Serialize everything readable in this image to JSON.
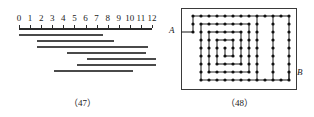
{
  "figures": [
    {
      "id": "fig47",
      "caption": "（47）",
      "type": "interval-diagram",
      "axis": {
        "labels": [
          "0",
          "1",
          "2",
          "3",
          "4",
          "5",
          "6",
          "7",
          "8",
          "9",
          "10",
          "11",
          "12"
        ],
        "min": 0,
        "max": 12,
        "tick_count": 13,
        "line_color": "#2b2b2b",
        "x_start_px": 19,
        "x_end_px": 152,
        "y_px": 28
      },
      "bars": [
        {
          "index": 1,
          "start": 0.0,
          "end": 7.6,
          "y_px": 34
        },
        {
          "index": 2,
          "start": 1.6,
          "end": 8.6,
          "y_px": 40
        },
        {
          "index": 3,
          "start": 1.6,
          "end": 11.6,
          "y_px": 46
        },
        {
          "index": 4,
          "start": 4.3,
          "end": 11.5,
          "y_px": 52
        },
        {
          "index": 5,
          "start": 6.1,
          "end": 12.4,
          "y_px": 58
        },
        {
          "index": 6,
          "start": 5.2,
          "end": 12.4,
          "y_px": 64
        },
        {
          "index": 7,
          "start": 3.2,
          "end": 10.3,
          "y_px": 70
        }
      ],
      "bar_color": "#4a4a4a"
    },
    {
      "id": "fig48",
      "caption": "（48）",
      "type": "spiral-maze-graph",
      "frame": {
        "x_px": 16,
        "y_px": 8,
        "w_px": 114,
        "h_px": 80,
        "border_color": "#3a3a3a"
      },
      "labels": [
        {
          "name": "A",
          "text": "A",
          "x_px": 4,
          "y_px": 26
        },
        {
          "name": "B",
          "text": "B",
          "x_px": 132,
          "y_px": 68
        }
      ],
      "graph": {
        "node_color": "#111111",
        "edge_color": "#2b2b2b",
        "node_radius": 1.6,
        "grid_origin_x": 28,
        "grid_origin_y": 16,
        "grid_step": 8,
        "cols": 11,
        "rows": 9,
        "entry_stub": {
          "from_x": 16,
          "to_x": 28,
          "y": 32
        },
        "exit_stub": {
          "x": 124,
          "from_y": 72,
          "to_y": 80
        },
        "polyline_grid": [
          [
            0,
            2
          ],
          [
            0,
            0
          ],
          [
            8,
            0
          ],
          [
            8,
            8
          ],
          [
            1,
            8
          ],
          [
            1,
            1
          ],
          [
            7,
            1
          ],
          [
            7,
            7
          ],
          [
            2,
            7
          ],
          [
            2,
            2
          ],
          [
            6,
            2
          ],
          [
            6,
            6
          ],
          [
            3,
            6
          ],
          [
            3,
            3
          ],
          [
            5,
            3
          ],
          [
            5,
            5
          ],
          [
            4,
            5
          ],
          [
            4,
            4
          ]
        ],
        "outer_right_path": [
          [
            12,
            0
          ],
          [
            12,
            8
          ]
        ],
        "outer_right_extra": [
          [
            10,
            0
          ],
          [
            10,
            8
          ]
        ]
      }
    }
  ]
}
